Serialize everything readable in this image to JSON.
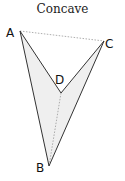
{
  "title": "Concave",
  "vertices": {
    "A": {
      "label": "A",
      "x": 20,
      "y": 31
    },
    "B": {
      "label": "B",
      "x": 49,
      "y": 166
    },
    "C": {
      "label": "C",
      "x": 104,
      "y": 41
    },
    "D": {
      "label": "D",
      "x": 61,
      "y": 93
    }
  },
  "edges_solid": [
    [
      "A",
      "D"
    ],
    [
      "D",
      "C"
    ],
    [
      "C",
      "B"
    ],
    [
      "B",
      "A"
    ]
  ],
  "edges_dashed": [
    [
      "A",
      "C"
    ],
    [
      "D",
      "B"
    ]
  ],
  "colors": {
    "fill": "#efefef",
    "stroke": "#333333",
    "dashed": "#999999"
  }
}
